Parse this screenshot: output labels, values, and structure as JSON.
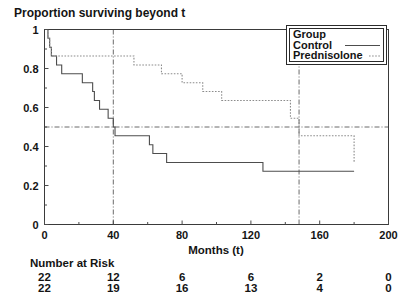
{
  "chart_data": {
    "type": "line",
    "subtype": "kaplan-meier-step",
    "title": "Proportion surviving beyond t",
    "xlabel": "Months (t)",
    "ylabel": "",
    "xlim": [
      0,
      200
    ],
    "ylim": [
      0,
      1
    ],
    "xticks": [
      0,
      40,
      80,
      120,
      160,
      200
    ],
    "xtick_labels": [
      "0",
      "40",
      "80",
      "120",
      "160",
      "200"
    ],
    "yticks": [
      0,
      0.2,
      0.4,
      0.6,
      0.8,
      1
    ],
    "ytick_labels": [
      "0",
      "0.2",
      "0.4",
      "0.6",
      "0.8",
      "1"
    ],
    "grid": false,
    "legend_position": "top-right",
    "legend_title": "Group",
    "series": [
      {
        "name": "Control",
        "style": "solid",
        "color": "#4d4d4d",
        "x": [
          0,
          2,
          3,
          4,
          7,
          10,
          22,
          28,
          29,
          32,
          37,
          40,
          41,
          54,
          61,
          63,
          71,
          127,
          180
        ],
        "y": [
          1.0,
          0.955,
          0.909,
          0.864,
          0.818,
          0.773,
          0.727,
          0.682,
          0.636,
          0.591,
          0.545,
          0.5,
          0.455,
          0.455,
          0.409,
          0.364,
          0.318,
          0.273,
          0.273
        ]
      },
      {
        "name": "Prednisolone",
        "style": "dotted",
        "color": "#8c8c8c",
        "x": [
          0,
          2,
          3,
          4,
          7,
          16,
          52,
          68,
          80,
          92,
          103,
          111,
          143,
          148,
          167,
          180
        ],
        "y": [
          1.0,
          0.955,
          0.909,
          0.864,
          0.864,
          0.864,
          0.818,
          0.773,
          0.727,
          0.682,
          0.636,
          0.636,
          0.545,
          0.455,
          0.455,
          0.318
        ]
      }
    ],
    "reference_lines": [
      {
        "orientation": "horizontal",
        "value": 0.5,
        "label": "median survival"
      },
      {
        "orientation": "vertical",
        "value": 40,
        "label": "control median"
      },
      {
        "orientation": "vertical",
        "value": 148,
        "label": "prednisolone median"
      }
    ]
  },
  "risk_table": {
    "heading": "Number at Risk",
    "times": [
      0,
      40,
      80,
      120,
      160,
      200
    ],
    "rows": [
      {
        "group": "Control",
        "values": [
          "22",
          "12",
          "6",
          "6",
          "2",
          "0"
        ]
      },
      {
        "group": "Prednisolone",
        "values": [
          "22",
          "19",
          "16",
          "13",
          "4",
          "0"
        ]
      }
    ]
  },
  "legend": {
    "title": "Group",
    "entries": [
      {
        "label": "Control",
        "style": "solid"
      },
      {
        "label": "Prednisolone",
        "style": "dotted"
      }
    ]
  }
}
